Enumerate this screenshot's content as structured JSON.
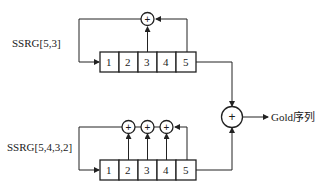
{
  "diagram": {
    "top_generator": {
      "label": "SSRG[5,3]",
      "cells": [
        "1",
        "2",
        "3",
        "4",
        "5"
      ],
      "taps": [
        3,
        5
      ],
      "xor_symbol": "+"
    },
    "bottom_generator": {
      "label": "SSRG[5,4,3,2]",
      "cells": [
        "1",
        "2",
        "3",
        "4",
        "5"
      ],
      "taps": [
        2,
        3,
        4,
        5
      ],
      "xor_symbols": [
        "+",
        "+",
        "+"
      ]
    },
    "combiner": {
      "xor_symbol": "+",
      "output_label": "Gold序列"
    }
  }
}
